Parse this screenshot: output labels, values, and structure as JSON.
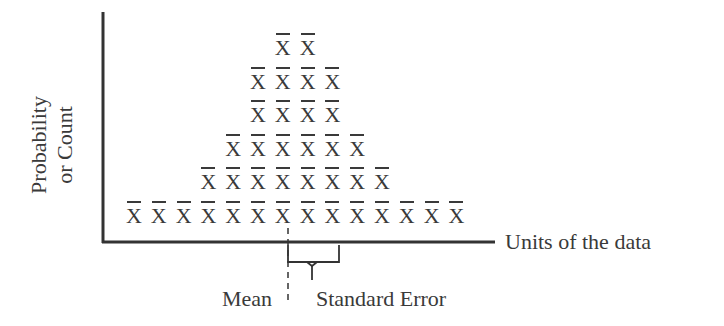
{
  "chart_data": {
    "type": "dot-plot",
    "title": "",
    "marker": "X̄",
    "xlabel": "Units of the data",
    "ylabel": "Probability or Count",
    "ylabel_lines": [
      "Probability",
      "or Count"
    ],
    "columns": 14,
    "counts_per_column": [
      1,
      1,
      1,
      2,
      3,
      5,
      6,
      6,
      5,
      3,
      2,
      1,
      1,
      1
    ],
    "rows": [
      {
        "level": 1,
        "count": 14,
        "start_col": 0
      },
      {
        "level": 2,
        "count": 8,
        "start_col": 3
      },
      {
        "level": 3,
        "count": 6,
        "start_col": 4
      },
      {
        "level": 4,
        "count": 4,
        "start_col": 5
      },
      {
        "level": 5,
        "count": 4,
        "start_col": 5
      },
      {
        "level": 6,
        "count": 2,
        "start_col": 6
      }
    ],
    "annotations": [
      {
        "text": "Mean",
        "type": "dashed-line",
        "position": "center of distribution"
      },
      {
        "text": "Standard Error",
        "type": "brace",
        "span": "mean to one SE right"
      }
    ],
    "grid": false,
    "legend": null
  },
  "labels": {
    "ylabel_line1": "Probability",
    "ylabel_line2": "or Count",
    "xlabel": "Units of the data",
    "mean": "Mean",
    "standard_error": "Standard Error",
    "marker": "X"
  }
}
